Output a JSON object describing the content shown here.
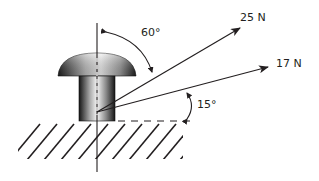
{
  "diagram": {
    "forces": [
      {
        "label": "25 N",
        "magnitude": 25,
        "unit": "N"
      },
      {
        "label": "17 N",
        "magnitude": 17,
        "unit": "N"
      }
    ],
    "angles": [
      {
        "label": "60°",
        "value": 60,
        "reference": "vertical axis"
      },
      {
        "label": "15°",
        "value": 15,
        "reference": "horizontal dashed line"
      }
    ],
    "colors": {
      "line": "#231f20",
      "background": "#ffffff"
    }
  }
}
